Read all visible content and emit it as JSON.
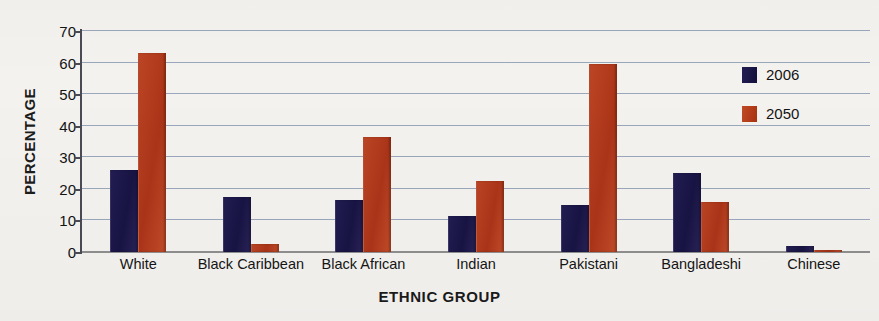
{
  "chart_data": {
    "type": "bar",
    "title": "",
    "xlabel": "ETHNIC GROUP",
    "ylabel": "PERCENTAGE",
    "ylim": [
      0,
      70
    ],
    "yticks": [
      0,
      10,
      20,
      30,
      40,
      50,
      60,
      70
    ],
    "grid": true,
    "legend_position": "right-inside",
    "categories": [
      "White",
      "Black Caribbean",
      "Black African",
      "Indian",
      "Pakistani",
      "Bangladeshi",
      "Chinese"
    ],
    "series": [
      {
        "name": "2006",
        "color": "#1e1a4d",
        "values": [
          26,
          17.5,
          16.5,
          11.5,
          15,
          25,
          2
        ]
      },
      {
        "name": "2050",
        "color": "#b63a1e",
        "values": [
          63,
          2.5,
          36.5,
          22.5,
          59.5,
          16,
          0.5
        ]
      }
    ]
  },
  "legend": {
    "items": [
      {
        "label": "2006",
        "swatch": "legend-swatch-2006"
      },
      {
        "label": "2050",
        "swatch": "legend-swatch-2050"
      }
    ]
  },
  "axes": {
    "y_title": "PERCENTAGE",
    "x_title": "ETHNIC GROUP",
    "y_tick_labels": [
      "70",
      "60",
      "50",
      "40",
      "30",
      "20",
      "10",
      "0"
    ]
  },
  "colors": {
    "series_2006": "#1e1a4d",
    "series_2050": "#b63a1e",
    "gridline": "#9aa6bb",
    "axis": "#4a4a55",
    "background": "#f4f2ef"
  }
}
